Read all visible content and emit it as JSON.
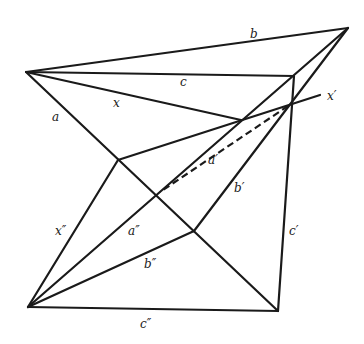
{
  "diagram": {
    "type": "geometric-construction",
    "points": {
      "A": [
        26,
        72
      ],
      "B": [
        348,
        28
      ],
      "C": [
        294,
        76
      ],
      "P": [
        241,
        120
      ],
      "X": [
        288,
        106
      ],
      "Xend": [
        320,
        95
      ],
      "Q": [
        118,
        160
      ],
      "R": [
        156,
        197
      ],
      "S": [
        194,
        231
      ],
      "L": [
        28,
        307
      ],
      "M": [
        278,
        311
      ],
      "D": [
        160,
        192
      ]
    },
    "labels": {
      "a": "a",
      "b": "b",
      "c": "c",
      "x": "x",
      "x_prime": "x′",
      "a_prime": "a′",
      "b_prime": "b′",
      "c_prime": "c′",
      "x_dprime": "x″",
      "a_dprime": "a″",
      "b_dprime": "b″",
      "c_dprime": "c″"
    },
    "line_color": "#1a1a1a"
  }
}
